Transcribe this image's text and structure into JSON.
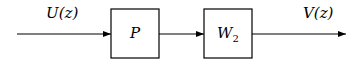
{
  "diagram": {
    "type": "block-diagram",
    "input_signal": "U(z)",
    "output_signal": "V(z)",
    "blocks": [
      {
        "id": "P",
        "label": "P"
      },
      {
        "id": "W2",
        "label": "W",
        "subscript": "2"
      }
    ],
    "connections": [
      {
        "from": "U(z)",
        "to": "P"
      },
      {
        "from": "P",
        "to": "W2"
      },
      {
        "from": "W2",
        "to": "V(z)"
      }
    ]
  }
}
